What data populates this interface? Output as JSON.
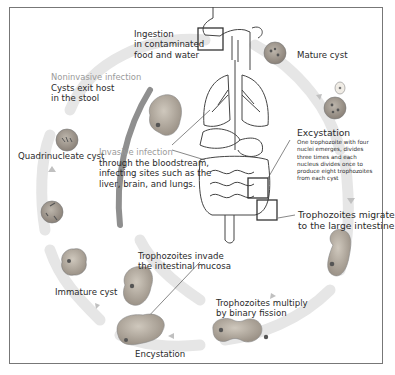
{
  "diagram": {
    "labels": {
      "ingestion": [
        "Ingestion",
        "in contaminated",
        "food and water"
      ],
      "mature_cyst": "Mature cyst",
      "noninvasive_heading": "Noninvasive infection",
      "noninvasive_body": [
        "Cysts exit host",
        "in the stool"
      ],
      "excystation_heading": "Excystation",
      "excystation_body": [
        "One trophozoite with four",
        "nuclei emerges, divides",
        "three times and each",
        "nucleus divides once to",
        "produce eight trophozoites",
        "from each cyst"
      ],
      "quadrinucleate": "Quadrinucleate cyst",
      "invasive_heading": "Invasive infection",
      "invasive_body": [
        "through the bloodstream,",
        "infecting sites such as the",
        "liver, brain, and lungs."
      ],
      "migrate": [
        "Trophozoites  migrate",
        "to the large intestine"
      ],
      "invade": [
        "Trophozoites invade",
        "the intestinal mucosa"
      ],
      "immature_cyst": "Immature cyst",
      "multiply": [
        "Trophozoites multiply",
        "by binary fission"
      ],
      "encystation": "Encystation"
    },
    "colors": {
      "frame": "#777777",
      "arrow_path": "#e4e4e4",
      "invasive_arrow": "#8a8a8a",
      "cyst_fill": "#a39a90",
      "trophozoite_fill": "#b5aca0",
      "nucleus": "#555555",
      "outline": "#444444",
      "grey_heading": "#9a9a9a"
    }
  }
}
